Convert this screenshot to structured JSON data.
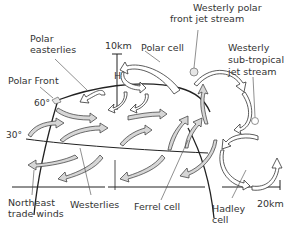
{
  "labels": {
    "westerly_polar_jet_line1": "Westerly polar",
    "westerly_polar_jet_line2": "front jet stream",
    "polar_easterlies_line1": "Polar",
    "polar_easterlies_line2": "easterlies",
    "altitude_10km": "10km",
    "polar_cell": "Polar cell",
    "westerly_subtropical_line1": "Westerly",
    "westerly_subtropical_line2": "sub-tropical",
    "westerly_subtropical_line3": "jet stream",
    "high_pressure": "H",
    "polar_front": "Polar Front",
    "lat_60": "60°",
    "lat_30": "30°",
    "northeast_trade_line1": "Northeast",
    "northeast_trade_line2": "trade winds",
    "westerlies": "Westerlies",
    "ferrel_cell": "Ferrel cell",
    "hadley_line1": "Hadley",
    "hadley_line2": "cell",
    "altitude_20km": "20km"
  },
  "colors": {
    "arrow_fill": "#d6d6d6",
    "outline": "#222222",
    "background": "#ffffff"
  }
}
